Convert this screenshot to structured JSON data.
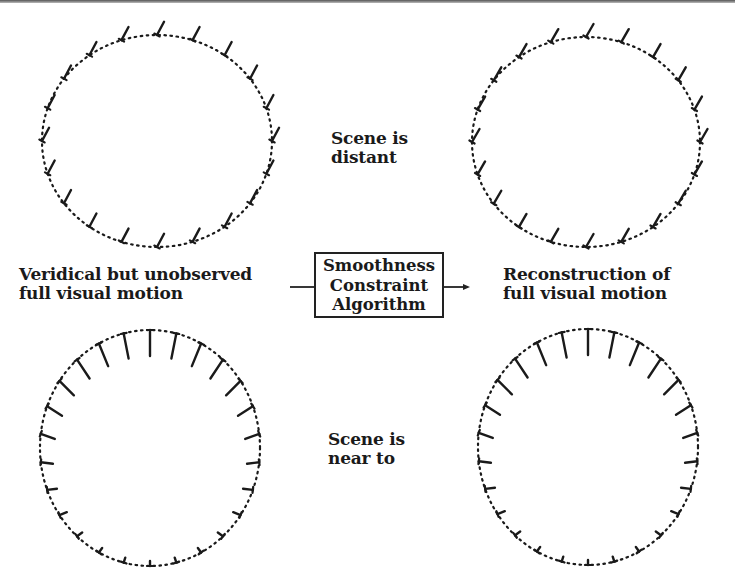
{
  "labels": {
    "input_line1": "Veridical but unobserved",
    "input_line2": "full visual motion",
    "algorithm_line1": "Smoothness",
    "algorithm_line2": "Constraint",
    "algorithm_line3": "Algorithm",
    "output_line1": "Reconstruction of",
    "output_line2": "full visual motion",
    "distant_line1": "Scene is",
    "distant_line2": "distant",
    "near_line1": "Scene is",
    "near_line2": "near to"
  },
  "colors": {
    "ink": "#1a1a1a",
    "background": "#ffffff"
  },
  "contours": [
    {
      "id": "veridical-distant",
      "cx": 157,
      "cy": 141,
      "rx": 115,
      "ry": 106,
      "vector_count": 20,
      "mode": "translation",
      "angle_deg": -62,
      "length": 15
    },
    {
      "id": "reconstructed-distant",
      "cx": 586,
      "cy": 142,
      "rx": 114,
      "ry": 105,
      "vector_count": 20,
      "mode": "translation",
      "angle_deg": -60,
      "length": 15
    },
    {
      "id": "veridical-near",
      "cx": 150,
      "cy": 448,
      "rx": 110,
      "ry": 118,
      "vector_count": 26,
      "mode": "expansion",
      "max_length": 26,
      "min_length": 5
    },
    {
      "id": "reconstructed-near",
      "cx": 588,
      "cy": 447,
      "rx": 110,
      "ry": 118,
      "vector_count": 26,
      "mode": "expansion",
      "max_length": 26,
      "min_length": 5
    }
  ],
  "arrows": {
    "input_line": {
      "x1": 290,
      "y1": 287,
      "x2": 314,
      "y2": 287
    },
    "output_arrow": {
      "x1": 444,
      "y1": 287,
      "x2": 470,
      "y2": 287
    }
  }
}
